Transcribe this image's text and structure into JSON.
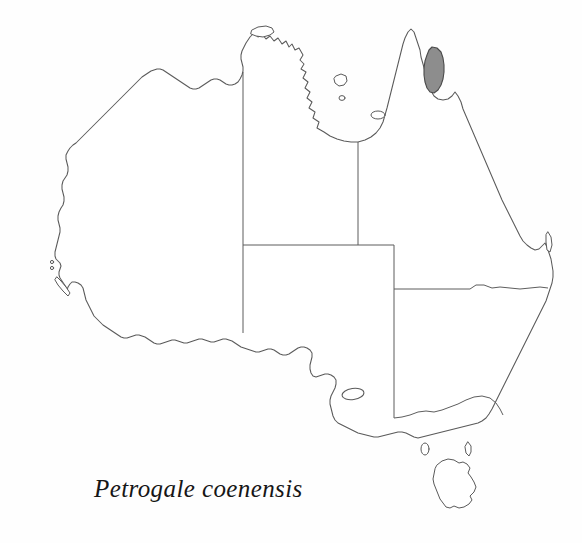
{
  "figure": {
    "caption": "Petrogale coenensis",
    "background_color": "#ffffff",
    "width": 582,
    "height": 543
  },
  "map": {
    "region_name": "Australia",
    "outline_color": "#5a5a5a",
    "fill_color": "#ffffff",
    "border_color": "#5d5d5d",
    "projection_note": "outline map of Australia with state boundaries"
  },
  "distribution": {
    "label": "Petrogale coenensis",
    "shading_color": "#8d8d8d",
    "shading_outline_color": "#4a4a4a",
    "location": "Cape York Peninsula, north Queensland",
    "bounds": {
      "x": 424,
      "y": 47,
      "width": 22,
      "height": 46
    }
  },
  "state_borders": [
    {
      "name": "wa-nt-border"
    },
    {
      "name": "nt-qld-border"
    },
    {
      "name": "sa-northern-border"
    },
    {
      "name": "sa-eastern-border"
    },
    {
      "name": "qld-nsw-border"
    },
    {
      "name": "nsw-vic-border"
    }
  ],
  "islands": [
    {
      "name": "tasmania"
    },
    {
      "name": "king-island"
    },
    {
      "name": "flinders-island"
    },
    {
      "name": "kangaroo-island"
    },
    {
      "name": "groote-eylandt"
    },
    {
      "name": "mornington-island"
    },
    {
      "name": "melville-island"
    },
    {
      "name": "fraser-island"
    },
    {
      "name": "dirk-hartog-island"
    },
    {
      "name": "bernier-dorre-islands"
    }
  ]
}
